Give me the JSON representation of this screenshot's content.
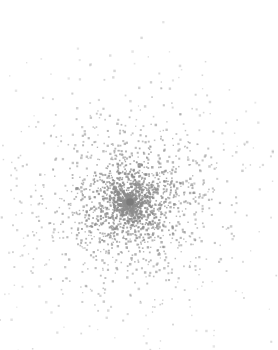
{
  "figure": {
    "width": 278,
    "height": 350,
    "background_color": "#ffffff",
    "has_axes": false,
    "has_border": false,
    "has_gridlines": false,
    "has_legend": false,
    "has_title": false,
    "has_tick_labels": false,
    "title": "",
    "subtitle": ""
  },
  "chart_data": {
    "type": "scatter",
    "title": "",
    "subtitle": "",
    "xlabel": "",
    "ylabel": "",
    "xlim": [
      0,
      278
    ],
    "ylim": [
      0,
      350
    ],
    "grid": false,
    "legend": null,
    "legend_position": "none",
    "axes_visible": false,
    "tick_labels_x": [],
    "tick_labels_y": [],
    "annotations": [],
    "background_color": "#ffffff",
    "description": "Radially-decaying point cloud (globular-cluster style density field) with a single larger dark marker at the centroid.",
    "series": [
      {
        "name": "cluster-points",
        "marker": "square-dot",
        "marker_color": "#8c8c8c",
        "marker_size_px": 1.6,
        "point_count": 2100,
        "distribution": "radial-exponential",
        "center_x": 130,
        "center_y": 202,
        "core_radius_px": 38,
        "scale_radius_px": 72,
        "max_radius_px": 230,
        "opacity_min": 0.28,
        "opacity_max": 0.95,
        "seed": 20240517
      },
      {
        "name": "center-marker",
        "marker": "circle",
        "marker_color": "#7a7a7a",
        "marker_size_px": 7.5,
        "point_count": 1,
        "points": [
          [
            130,
            202
          ]
        ]
      }
    ]
  }
}
